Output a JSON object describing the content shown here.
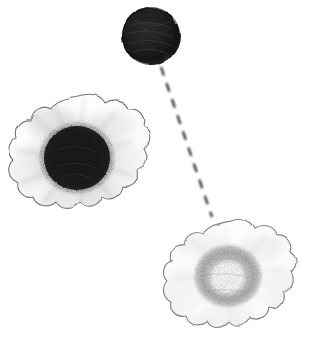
{
  "figure": {
    "title": "Hand-drawn grayscale illustration of three rounded cellular blobs connected by a dashed line",
    "background_color": "#ffffff",
    "width": 331,
    "height": 343,
    "ink_color": "#1a1a1a",
    "mid_gray": "#8a8a8a",
    "light_gray": "#d8d8d8",
    "outline_gray": "#6f6f6f"
  },
  "objects": [
    {
      "id": "solid-dark-circle",
      "name": "dark-solid-blob",
      "shape": "circle",
      "cx": 151,
      "cy": 36,
      "r": 29,
      "fill": "#232323",
      "has_petals": false,
      "center_tone": "dark"
    },
    {
      "id": "dark-center-flower",
      "name": "flower-dark-center",
      "shape": "lobed-blob",
      "cx": 79,
      "cy": 155,
      "rx": 66,
      "ry": 59,
      "petal_count": 11,
      "core_cx": 77,
      "core_cy": 158,
      "core_r": 33,
      "core_fill": "#1f1f1f",
      "halo_fill": "#9a9a9a",
      "petal_fill": "#fdfdfd",
      "outline": "#5a5a5a",
      "center_tone": "dark"
    },
    {
      "id": "light-center-flower",
      "name": "flower-light-ring-center",
      "shape": "lobed-blob",
      "cx": 230,
      "cy": 276,
      "rx": 62,
      "ry": 55,
      "petal_count": 11,
      "core_cx": 228,
      "core_cy": 276,
      "core_outer_r": 33,
      "core_inner_r": 17,
      "ring_fill": "#b9b9b9",
      "inner_fill": "#f2f2f2",
      "petal_fill": "#fefefe",
      "outline": "#7a7a7a",
      "center_tone": "light"
    }
  ],
  "connector": {
    "id": "dashed-connector",
    "name": "dashed-connector-line",
    "from_object": "solid-dark-circle",
    "to_object": "light-center-flower",
    "x1": 161,
    "y1": 67,
    "x2": 212,
    "y2": 217,
    "stroke": "#1f1f1f",
    "stroke_width": 2,
    "dash_pattern": "9 8",
    "style": "dashed"
  }
}
